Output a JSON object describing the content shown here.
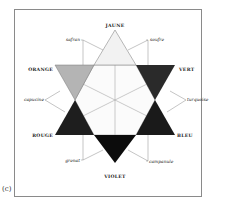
{
  "figure": {
    "caption": "(c)",
    "primary_labels": {
      "jaune": "JAUNE",
      "orange": "ORANGE",
      "vert": "VERT",
      "rouge": "ROUGE",
      "bleu": "BLEU",
      "violet": "VIOLET"
    },
    "secondary_labels": {
      "safran": "safran",
      "soufre": "soufre",
      "capucine": "capucine",
      "turquoise": "turquoise",
      "grenat": "grenat",
      "campanule": "campanule"
    },
    "colors": {
      "jaune": "#f2f2f2",
      "orange": "#b4b4b4",
      "vert": "#2a2a2a",
      "rouge": "#1e1e1e",
      "bleu": "#1a1a1a",
      "violet": "#0c0c0c",
      "hexagon": "#fbfbfb",
      "lines": "#9a9a9a"
    }
  }
}
